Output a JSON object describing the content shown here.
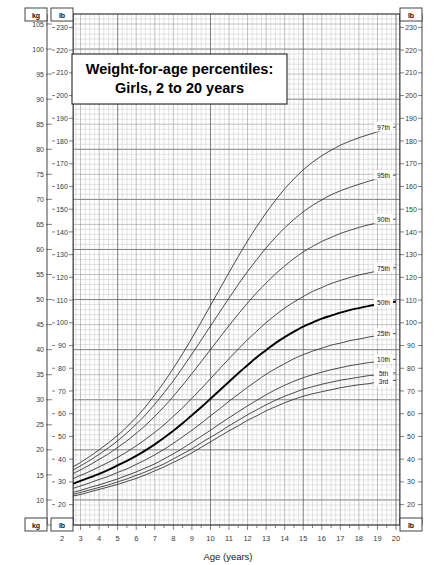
{
  "chart_data": {
    "type": "line",
    "title": "Weight-for-age percentiles:",
    "subtitle": "Girls, 2 to 20 years",
    "xlabel": "Age (years)",
    "ylabel_left_unit": "kg",
    "ylabel_right_unit": "lb",
    "top_left_unit": "kg",
    "top_right_unit": "lb",
    "bottom_left_unit_kg": "kg",
    "bottom_left_unit_lb": "lb",
    "bottom_right_unit": "lb",
    "xlim": [
      2,
      20
    ],
    "ylim_kg": [
      5,
      107
    ],
    "ylim_lb": [
      11,
      236
    ],
    "grid": true,
    "legend_position": "right-inline",
    "x_tick_labels": [
      "2",
      "3",
      "4",
      "5",
      "6",
      "7",
      "8",
      "9",
      "10",
      "11",
      "12",
      "13",
      "14",
      "15",
      "16",
      "17",
      "18",
      "19",
      "20"
    ],
    "x_ticks": [
      2,
      3,
      4,
      5,
      6,
      7,
      8,
      9,
      10,
      11,
      12,
      13,
      14,
      15,
      16,
      17,
      18,
      19,
      20
    ],
    "y_ticks_kg": [
      5,
      10,
      15,
      20,
      25,
      30,
      35,
      40,
      45,
      50,
      55,
      60,
      65,
      70,
      75,
      80,
      85,
      90,
      95,
      100,
      105
    ],
    "y_tick_labels_kg": [
      "5",
      "10",
      "15",
      "20",
      "25",
      "30",
      "35",
      "40",
      "45",
      "50",
      "55",
      "60",
      "65",
      "70",
      "75",
      "80",
      "85",
      "90",
      "95",
      "100",
      "105"
    ],
    "y_ticks_lb": [
      20,
      30,
      40,
      50,
      60,
      70,
      80,
      90,
      100,
      110,
      120,
      130,
      140,
      150,
      160,
      170,
      180,
      190,
      200,
      210,
      220,
      230
    ],
    "y_tick_labels_lb": [
      "20",
      "30",
      "40",
      "50",
      "60",
      "70",
      "80",
      "90",
      "100",
      "110",
      "120",
      "130",
      "140",
      "150",
      "160",
      "170",
      "180",
      "190",
      "200",
      "210",
      "220",
      "230"
    ],
    "x": [
      2,
      2.5,
      3,
      3.5,
      4,
      4.5,
      5,
      5.5,
      6,
      6.5,
      7,
      7.5,
      8,
      8.5,
      9,
      9.5,
      10,
      10.5,
      11,
      11.5,
      12,
      12.5,
      13,
      13.5,
      14,
      14.5,
      15,
      15.5,
      16,
      16.5,
      17,
      17.5,
      18,
      18.5,
      19,
      19.5,
      20
    ],
    "series": [
      {
        "name": "97th",
        "label": "97th",
        "bold": false,
        "values": [
          15.3,
          16.4,
          17.5,
          18.7,
          20.0,
          21.4,
          22.9,
          24.6,
          26.5,
          28.6,
          31.0,
          33.5,
          36.3,
          39.2,
          42.3,
          45.5,
          48.8,
          52.1,
          55.4,
          58.6,
          61.7,
          64.6,
          67.3,
          69.8,
          72.1,
          74.1,
          75.9,
          77.4,
          78.7,
          79.8,
          80.8,
          81.6,
          82.3,
          82.9,
          83.5,
          84.0,
          84.5
        ]
      },
      {
        "name": "95th",
        "label": "95th",
        "bold": false,
        "values": [
          14.8,
          15.8,
          16.8,
          17.9,
          19.1,
          20.4,
          21.8,
          23.4,
          25.1,
          27.0,
          29.1,
          31.4,
          33.8,
          36.4,
          39.1,
          41.9,
          44.7,
          47.5,
          50.3,
          53.0,
          55.6,
          58.0,
          60.3,
          62.4,
          64.3,
          66.0,
          67.5,
          68.8,
          69.9,
          70.9,
          71.7,
          72.4,
          73.0,
          73.6,
          74.1,
          74.5,
          74.9
        ]
      },
      {
        "name": "90th",
        "label": "90th",
        "bold": false,
        "values": [
          14.2,
          15.1,
          16.0,
          17.0,
          18.1,
          19.2,
          20.5,
          21.8,
          23.3,
          24.9,
          26.7,
          28.6,
          30.7,
          32.9,
          35.2,
          37.6,
          40.0,
          42.4,
          44.8,
          47.1,
          49.3,
          51.4,
          53.3,
          55.1,
          56.7,
          58.2,
          59.5,
          60.6,
          61.6,
          62.4,
          63.2,
          63.8,
          64.4,
          64.9,
          65.3,
          65.7,
          66.1
        ]
      },
      {
        "name": "75th",
        "label": "75th",
        "bold": false,
        "values": [
          13.3,
          14.1,
          14.9,
          15.7,
          16.6,
          17.5,
          18.5,
          19.6,
          20.8,
          22.1,
          23.5,
          25.0,
          26.7,
          28.4,
          30.3,
          32.2,
          34.2,
          36.2,
          38.2,
          40.1,
          42.0,
          43.7,
          45.4,
          46.9,
          48.3,
          49.5,
          50.6,
          51.6,
          52.4,
          53.2,
          53.8,
          54.4,
          54.9,
          55.3,
          55.7,
          56.1,
          56.4
        ]
      },
      {
        "name": "50th",
        "label": "50th",
        "bold": true,
        "values": [
          12.4,
          13.1,
          13.8,
          14.5,
          15.2,
          16.0,
          16.9,
          17.8,
          18.8,
          19.9,
          21.1,
          22.4,
          23.8,
          25.3,
          26.9,
          28.5,
          30.2,
          31.9,
          33.6,
          35.3,
          36.9,
          38.5,
          39.9,
          41.3,
          42.5,
          43.6,
          44.6,
          45.4,
          46.2,
          46.8,
          47.4,
          47.9,
          48.3,
          48.7,
          49.0,
          49.3,
          49.6
        ]
      },
      {
        "name": "25th",
        "label": "25th",
        "bold": false,
        "values": [
          11.6,
          12.2,
          12.8,
          13.4,
          14.1,
          14.7,
          15.5,
          16.2,
          17.1,
          18.0,
          19.0,
          20.1,
          21.3,
          22.6,
          23.9,
          25.3,
          26.8,
          28.2,
          29.7,
          31.1,
          32.5,
          33.8,
          35.1,
          36.2,
          37.2,
          38.2,
          39.0,
          39.7,
          40.3,
          40.9,
          41.3,
          41.8,
          42.1,
          42.5,
          42.8,
          43.0,
          43.3
        ]
      },
      {
        "name": "10th",
        "label": "10th",
        "bold": false,
        "values": [
          10.9,
          11.4,
          11.9,
          12.5,
          13.0,
          13.6,
          14.2,
          14.9,
          15.6,
          16.4,
          17.2,
          18.2,
          19.2,
          20.3,
          21.5,
          22.7,
          23.9,
          25.2,
          26.4,
          27.6,
          28.8,
          29.9,
          31.0,
          32.0,
          32.9,
          33.7,
          34.4,
          35.0,
          35.5,
          36.0,
          36.4,
          36.8,
          37.1,
          37.4,
          37.6,
          37.9,
          38.1
        ]
      },
      {
        "name": "5th",
        "label": "5th",
        "bold": false,
        "values": [
          10.5,
          11.0,
          11.5,
          12.0,
          12.5,
          13.0,
          13.6,
          14.2,
          14.9,
          15.6,
          16.4,
          17.2,
          18.2,
          19.2,
          20.2,
          21.4,
          22.5,
          23.6,
          24.8,
          25.9,
          27.0,
          28.0,
          29.0,
          29.9,
          30.7,
          31.4,
          32.1,
          32.6,
          33.1,
          33.5,
          33.9,
          34.2,
          34.5,
          34.8,
          35.0,
          35.2,
          35.4
        ]
      },
      {
        "name": "3rd",
        "label": "3rd",
        "bold": false,
        "values": [
          10.2,
          10.7,
          11.1,
          11.6,
          12.1,
          12.6,
          13.1,
          13.7,
          14.3,
          15.0,
          15.8,
          16.6,
          17.5,
          18.4,
          19.4,
          20.5,
          21.6,
          22.7,
          23.8,
          24.8,
          25.9,
          26.8,
          27.8,
          28.6,
          29.4,
          30.1,
          30.7,
          31.2,
          31.6,
          32.0,
          32.4,
          32.7,
          33.0,
          33.2,
          33.5,
          33.7,
          33.9
        ]
      }
    ]
  }
}
